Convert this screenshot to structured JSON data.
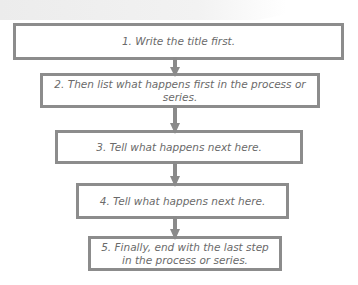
{
  "diagram": {
    "type": "flowchart",
    "direction": "top-to-bottom",
    "colors": {
      "border": "#8c8c8c",
      "arrow": "#8a8a8a",
      "text": "#6a6a6a",
      "background": "#ffffff"
    },
    "steps": [
      {
        "label": "1. Write the title first."
      },
      {
        "label": "2. Then list what happens first in the process or series."
      },
      {
        "label": "3. Tell what happens next here."
      },
      {
        "label": "4. Tell what happens next here."
      },
      {
        "label": "5. Finally, end with the last step in the process or series."
      }
    ],
    "connectors": [
      {
        "from": 1,
        "to": 2
      },
      {
        "from": 2,
        "to": 3
      },
      {
        "from": 3,
        "to": 4
      },
      {
        "from": 4,
        "to": 5
      }
    ]
  }
}
